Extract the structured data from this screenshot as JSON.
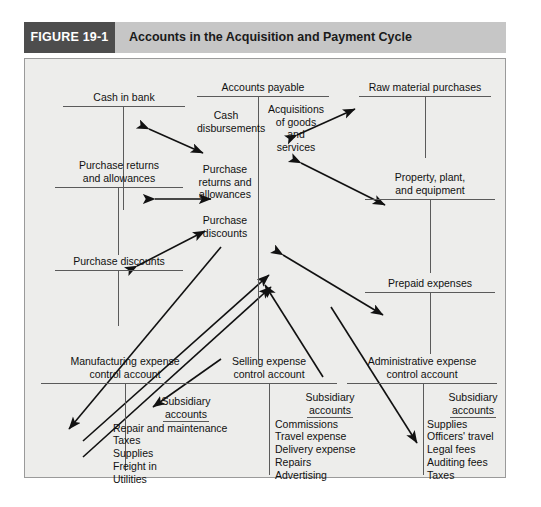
{
  "header": {
    "figure_label": "FIGURE 19-1",
    "title": "Accounts in the Acquisition and Payment Cycle",
    "tab_color": "#4d4d4d",
    "bar_color": "#c6c6c6"
  },
  "accounts": {
    "cash_in_bank": "Cash in bank",
    "accounts_payable": "Accounts payable",
    "raw_material_purchases": "Raw material purchases",
    "purchase_returns_allowances": "Purchase returns\nand allowances",
    "purchase_returns_allowances_l1": "Purchase returns",
    "purchase_returns_allowances_l2": "and allowances",
    "purchase_discounts": "Purchase discounts",
    "property_plant_equipment_l1": "Property, plant,",
    "property_plant_equipment_l2": "and equipment",
    "prepaid_expenses": "Prepaid expenses",
    "manufacturing_l1": "Manufacturing expense",
    "manufacturing_l2": "control account",
    "selling_l1": "Selling expense",
    "selling_l2": "control account",
    "administrative_l1": "Administrative expense",
    "administrative_l2": "control account"
  },
  "entries": {
    "cash_disbursements_l1": "Cash",
    "cash_disbursements_l2": "disbursements",
    "acquisitions_l1": "Acquisitions",
    "acquisitions_l2": "of goods",
    "acquisitions_l3": "and",
    "acquisitions_l4": "services",
    "ap_returns_l1": "Purchase",
    "ap_returns_l2": "returns and",
    "ap_returns_l3": "allowances",
    "ap_discounts_l1": "Purchase",
    "ap_discounts_l2": "discounts"
  },
  "subsidiary": {
    "heading_l1": "Subsidiary",
    "heading_l2": "accounts",
    "manufacturing_items": [
      "Repair and maintenance",
      "Taxes",
      "Supplies",
      "Freight in",
      "Utilities"
    ],
    "selling_items": [
      "Commissions",
      "Travel expense",
      "Delivery expense",
      "Repairs",
      "Advertising"
    ],
    "administrative_items": [
      "Supplies",
      "Officers' travel",
      "Legal fees",
      "Auditing fees",
      "Taxes"
    ]
  }
}
